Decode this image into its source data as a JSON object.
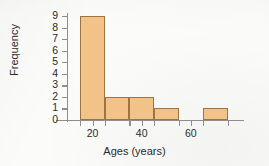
{
  "chart_data": {
    "type": "bar",
    "title": "",
    "xlabel": "Ages (years)",
    "ylabel": "Frequency",
    "xlim": [
      10,
      80
    ],
    "ylim": [
      0,
      9
    ],
    "grid": false,
    "legend": null,
    "bin_width": 10,
    "bin_edges": [
      15,
      25,
      35,
      45,
      55,
      65,
      75
    ],
    "categories": [
      "15-25",
      "25-35",
      "35-45",
      "45-55",
      "55-65",
      "65-75"
    ],
    "values": [
      9,
      2,
      2,
      1,
      0,
      1
    ],
    "x_ticks": [
      20,
      40,
      60
    ],
    "x_tick_labels": [
      "20",
      "40",
      "60"
    ],
    "x_minor_ticks": [
      15,
      25,
      35,
      45,
      55,
      65,
      75
    ],
    "y_ticks": [
      0,
      1,
      2,
      3,
      4,
      5,
      6,
      7,
      8,
      9
    ],
    "y_tick_labels": [
      "0",
      "1",
      "2",
      "3",
      "4",
      "5",
      "6",
      "7",
      "8",
      "9"
    ],
    "bar_fill_color": "#f2c389",
    "bar_border_color": "#9d7442",
    "axis_color": "#8e8e8e",
    "text_color": "#2b2b2b",
    "background_color": "#fbfbf9"
  }
}
